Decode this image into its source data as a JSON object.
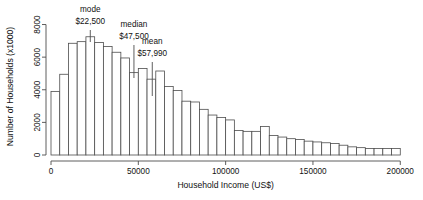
{
  "chart_data": {
    "type": "bar",
    "title": "",
    "subtitle": "",
    "xlabel": "Household Income (US$)",
    "ylabel": "Number of Households (x1000)",
    "xlim": [
      0,
      205000
    ],
    "ylim": [
      0,
      8400
    ],
    "bin_width": 5000,
    "grid": false,
    "legend": "none",
    "xticks": [
      0,
      50000,
      100000,
      150000,
      200000
    ],
    "xtick_labels": [
      "0",
      "50000",
      "100000",
      "150000",
      "200000"
    ],
    "yticks": [
      0,
      2000,
      4000,
      6000,
      8000
    ],
    "ytick_labels": [
      "0",
      "2000",
      "4000",
      "6000",
      "8000"
    ],
    "x": [
      2500,
      7500,
      12500,
      17500,
      22500,
      27500,
      32500,
      37500,
      42500,
      47500,
      52500,
      57500,
      62500,
      67500,
      72500,
      77500,
      82500,
      87500,
      92500,
      97500,
      102500,
      107500,
      112500,
      117500,
      122500,
      127500,
      132500,
      137500,
      142500,
      147500,
      152500,
      157500,
      162500,
      167500,
      172500,
      177500,
      182500,
      187500,
      192500,
      197500
    ],
    "categories": [
      "0-5000",
      "5000-10000",
      "10000-15000",
      "15000-20000",
      "20000-25000",
      "25000-30000",
      "30000-35000",
      "35000-40000",
      "40000-45000",
      "45000-50000",
      "50000-55000",
      "55000-60000",
      "60000-65000",
      "65000-70000",
      "70000-75000",
      "75000-80000",
      "80000-85000",
      "85000-90000",
      "90000-95000",
      "95000-100000",
      "100000-105000",
      "105000-110000",
      "110000-115000",
      "115000-120000",
      "120000-125000",
      "125000-130000",
      "130000-135000",
      "135000-140000",
      "140000-145000",
      "145000-150000",
      "150000-155000",
      "155000-160000",
      "160000-165000",
      "165000-170000",
      "170000-175000",
      "175000-180000",
      "180000-185000",
      "185000-190000",
      "190000-195000",
      "195000-200000"
    ],
    "values": [
      3900,
      4950,
      6850,
      6950,
      7250,
      6900,
      6650,
      6300,
      5950,
      5050,
      5300,
      4650,
      5150,
      4200,
      3950,
      3300,
      3250,
      2800,
      2450,
      2300,
      2150,
      1500,
      1450,
      1450,
      1750,
      1200,
      1100,
      1000,
      950,
      850,
      800,
      750,
      700,
      600,
      500,
      450,
      400,
      400,
      400,
      400
    ],
    "annotations": [
      {
        "name": "mode",
        "label": "mode",
        "value_label": "$22,500",
        "x": 22500
      },
      {
        "name": "median",
        "label": "median",
        "value_label": "$47,500",
        "x": 47500
      },
      {
        "name": "mean",
        "label": "mean",
        "value_label": "$57,990",
        "x": 57990
      }
    ]
  }
}
